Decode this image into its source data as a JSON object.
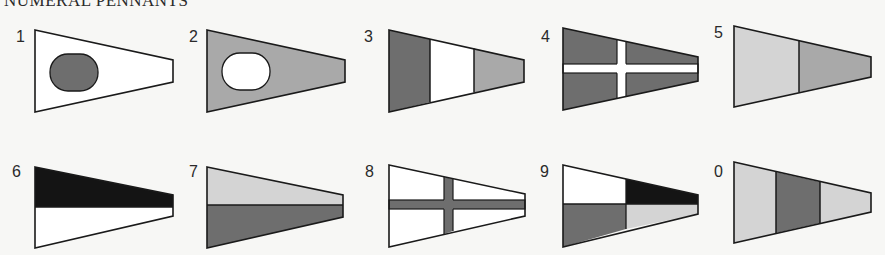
{
  "title": "NUMERAL PENNANTS",
  "colors": {
    "dark": "#6e6e6e",
    "mid": "#a9a9a9",
    "light": "#d4d4d4",
    "black": "#141414",
    "white": "#ffffff",
    "outline": "#1a1a1a"
  },
  "pennants": [
    {
      "label": "1",
      "design": "white field with dark oval"
    },
    {
      "label": "2",
      "design": "mid-grey field with white oval"
    },
    {
      "label": "3",
      "design": "vertical thirds: dark, white, mid-grey"
    },
    {
      "label": "4",
      "design": "dark field with white cross"
    },
    {
      "label": "5",
      "design": "vertical halves: light grey, mid grey"
    },
    {
      "label": "6",
      "design": "horizontal halves: black over white"
    },
    {
      "label": "7",
      "design": "horizontal halves: light grey over dark grey"
    },
    {
      "label": "8",
      "design": "white field with dark cross"
    },
    {
      "label": "9",
      "design": "quartered: white, black, dark grey, light grey"
    },
    {
      "label": "0",
      "design": "vertical thirds: light grey, dark grey, light grey"
    }
  ]
}
